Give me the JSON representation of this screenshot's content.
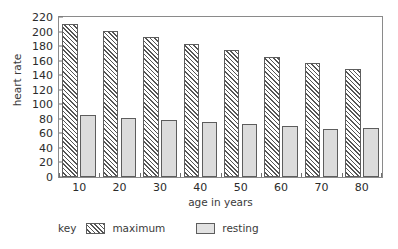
{
  "chart_data": {
    "type": "bar",
    "title": "",
    "xlabel": "age in years",
    "ylabel": "heart rate",
    "categories": [
      "10",
      "20",
      "30",
      "40",
      "50",
      "60",
      "70",
      "80"
    ],
    "series": [
      {
        "name": "maximum",
        "values": [
          210,
          201,
          193,
          183,
          175,
          165,
          157,
          148
        ]
      },
      {
        "name": "resting",
        "values": [
          85,
          81,
          79,
          76,
          73,
          70,
          66,
          67
        ]
      }
    ],
    "ylim": [
      0,
      220
    ],
    "ytick_labels": [
      "0",
      "20",
      "40",
      "60",
      "80",
      "100",
      "120",
      "140",
      "160",
      "180",
      "200",
      "220"
    ],
    "ytick_values": [
      0,
      20,
      40,
      60,
      80,
      100,
      120,
      140,
      160,
      180,
      200,
      220
    ],
    "grid": false,
    "legend_position": "below-left"
  },
  "legend": {
    "key_label": "key",
    "entries": [
      {
        "label": "maximum",
        "swatch": "hatched-swatch-icon"
      },
      {
        "label": "resting",
        "swatch": "solid-swatch-icon"
      }
    ]
  }
}
